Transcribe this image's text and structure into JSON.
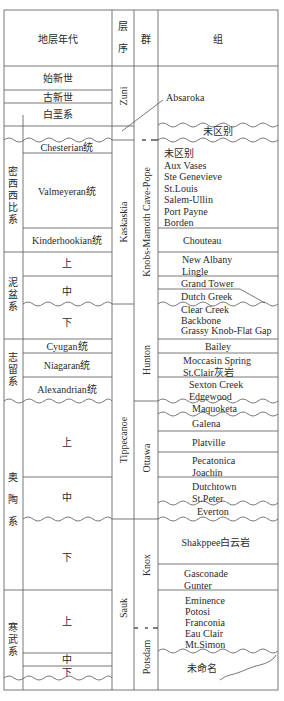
{
  "header": {
    "age": "地层年代",
    "sequence": "层序",
    "group": "群",
    "formation": "组"
  },
  "systems": {
    "eocene": "始新世",
    "paleocene": "古新世",
    "cretaceous": "白垩系",
    "mississippian": "密西西比系",
    "devonian": "泥盆系",
    "silurian": "志留系",
    "ordovician": "奥陶系",
    "cambrian": "寒武系"
  },
  "series": {
    "chesterian": "Chesterian统",
    "valmeyeran": "Valmeyeran统",
    "kinderhookian": "Kinderhookian统",
    "dev_upper": "上",
    "dev_middle": "中",
    "dev_lower": "下",
    "cyugan": "Cyugan统",
    "niagaran": "Niagaran统",
    "alexandrian": "Alexandrian统",
    "ord_upper": "上",
    "ord_middle": "中",
    "ord_lower": "下",
    "cam_upper": "上",
    "cam_middle": "中",
    "cam_lower": "下"
  },
  "sequences": {
    "zuni": "Zuni",
    "kaskaskia": "Kaskaskia",
    "tippecanoe": "Tippecanoe",
    "sauk": "Sauk"
  },
  "groups": {
    "knobs": "Knobs-Mamoth Cave-Pope",
    "hunton": "Hunton",
    "ottawa": "Ottawa",
    "knox": "Knox",
    "potsdam": "Potsdam"
  },
  "formations": {
    "absaroka": "Absaroka",
    "undiff_top": "未区别",
    "chester_block": [
      "未区别",
      "Aux Vases",
      "Ste Genevieve",
      "St.Louis",
      "Salem-Ullin",
      "Port Payne",
      "Borden"
    ],
    "chouteau": "Chouteau",
    "new_albany": [
      "New Albany",
      "Lingle"
    ],
    "grand_tower": "Grand Tower",
    "dutch_greek": "Dutch Greek",
    "clear_creek": [
      "Clear Creek",
      "Backbone",
      "Grassy Knob-Flat Gap"
    ],
    "bailey": "Bailey",
    "moccasin": [
      "Moccasin Spring",
      "St.Clair灰岩"
    ],
    "sexton": [
      "Sexton Creek",
      "Edgewood"
    ],
    "maquoketa": "Maquoketa",
    "galena": "Galena",
    "platville": "Platville",
    "pecatonica": [
      "Pecatonica",
      "Joachin"
    ],
    "dutchtown": [
      "Dutchtown",
      "St.Peter"
    ],
    "everton": "Everton",
    "shakopee": "Shakppee白云岩",
    "gasconade": [
      "Gasconade",
      "Gunter"
    ],
    "eminence": [
      "Eminence",
      "Potosi",
      "Franconia",
      "Eau Clair",
      "Mt.Simon"
    ],
    "unnamed": "未命名"
  },
  "colors": {
    "line": "#555555",
    "text": "#2a2a2a"
  }
}
